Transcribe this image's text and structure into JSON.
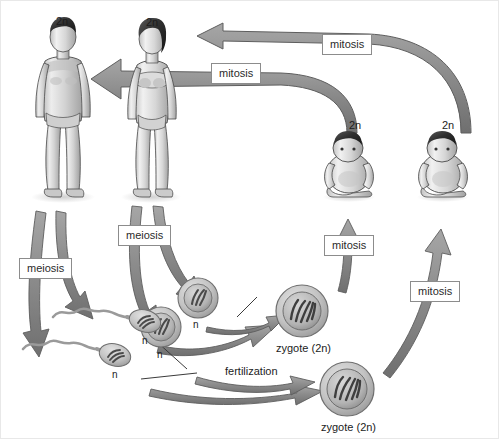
{
  "diagram": {
    "background_color": "#ffffff",
    "arrow_color": "#8a8a8a",
    "arrow_outline_color": "#5a5a5a",
    "label_box_border_color": "#8c8c8c",
    "text_color": "#1c1c1c"
  },
  "process_labels": {
    "mitosis_top_right": "mitosis",
    "mitosis_top_left": "mitosis",
    "mitosis_baby_left": "mitosis",
    "mitosis_baby_right": "mitosis",
    "meiosis_male": "meiosis",
    "meiosis_female": "meiosis"
  },
  "ploidy_labels": {
    "adult_male": "2n",
    "adult_female": "2n",
    "baby_left": "2n",
    "baby_right": "2n",
    "egg_upper": "n",
    "egg_lower": "n",
    "sperm_upper": "n",
    "sperm_lower": "n"
  },
  "cell_labels": {
    "fertilization": "fertilization",
    "zygote_upper": "zygote (2n)",
    "zygote_lower": "zygote (2n)"
  },
  "organisms": [
    {
      "name": "adult-male",
      "ploidy": "2n",
      "stage": "adult"
    },
    {
      "name": "adult-female",
      "ploidy": "2n",
      "stage": "adult"
    },
    {
      "name": "infant-left",
      "ploidy": "2n",
      "stage": "infant"
    },
    {
      "name": "infant-right",
      "ploidy": "2n",
      "stage": "infant"
    }
  ],
  "gametes": [
    {
      "name": "egg-upper",
      "ploidy": "n",
      "type": "egg"
    },
    {
      "name": "egg-lower",
      "ploidy": "n",
      "type": "egg"
    },
    {
      "name": "sperm-upper",
      "ploidy": "n",
      "type": "sperm"
    },
    {
      "name": "sperm-lower",
      "ploidy": "n",
      "type": "sperm"
    }
  ]
}
